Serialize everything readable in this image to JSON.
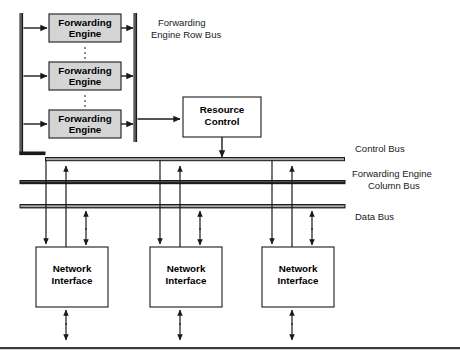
{
  "diagram": {
    "colors": {
      "box_fill_shaded": "#d4d4d4",
      "box_fill_plain": "#ffffff",
      "stroke": "#1a1a1a",
      "bus_highlight": "#a8a8a8",
      "background": "#ffffff"
    },
    "forwarding_engines": [
      {
        "line1": "Forwarding",
        "line2": "Engine"
      },
      {
        "line1": "Forwarding",
        "line2": "Engine"
      },
      {
        "line1": "Forwarding",
        "line2": "Engine"
      }
    ],
    "ellipsis_glyph": ":",
    "resource_control": {
      "line1": "Resource",
      "line2": "Control"
    },
    "network_interfaces": [
      {
        "line1": "Network",
        "line2": "Interface"
      },
      {
        "line1": "Network",
        "line2": "Interface"
      },
      {
        "line1": "Network",
        "line2": "Interface"
      }
    ],
    "bus_labels": {
      "row_bus_line1": "Forwarding",
      "row_bus_line2": "Engine Row Bus",
      "control_bus": "Control Bus",
      "column_bus_line1": "Forwarding Engine",
      "column_bus_line2": "Column Bus",
      "data_bus": "Data Bus"
    }
  }
}
